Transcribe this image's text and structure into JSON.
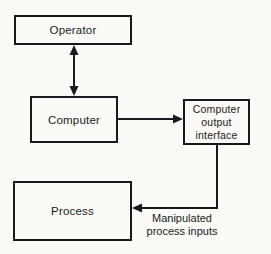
{
  "diagram": {
    "nodes": {
      "operator": {
        "label": "Operator"
      },
      "computer": {
        "label": "Computer"
      },
      "output_interface": {
        "lines": [
          "Computer",
          "output",
          "interface"
        ]
      },
      "process": {
        "label": "Process"
      }
    },
    "edge_labels": {
      "manipulated": {
        "lines": [
          "Manipulated",
          "process inputs"
        ]
      }
    },
    "edges": [
      {
        "from": "operator",
        "to": "computer",
        "direction": "bidirectional"
      },
      {
        "from": "computer",
        "to": "output_interface",
        "direction": "forward"
      },
      {
        "from": "output_interface",
        "to": "process",
        "direction": "forward",
        "label": "Manipulated process inputs"
      }
    ],
    "colors": {
      "line": "#1a1a1a",
      "background": "#fbfaf6"
    }
  }
}
